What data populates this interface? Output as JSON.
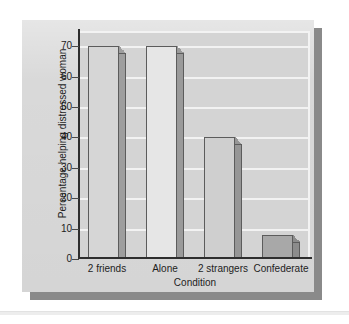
{
  "chart_data": {
    "type": "bar",
    "title": "",
    "subtitle": "",
    "categories": [
      "2 friends",
      "Alone",
      "2 strangers",
      "Confederate"
    ],
    "values": [
      70,
      70,
      40,
      8
    ],
    "series": [
      {
        "name": "Percentage helping distressed woman",
        "values": [
          70,
          70,
          40,
          8
        ]
      }
    ],
    "xlabel": "Condition",
    "ylabel": "Percentage helping distressed woman",
    "ylim": [
      0,
      75
    ],
    "yticks": [
      0,
      10,
      20,
      30,
      40,
      50,
      60,
      70
    ],
    "ytick_labels": [
      "0",
      "10",
      "20",
      "30",
      "40",
      "50",
      "60",
      "70"
    ],
    "grid": true,
    "gridline_color": "#f2f2f2",
    "legend": false,
    "legend_position": "none",
    "bar_colors": [
      "#d6d6d6",
      "#e6e6e6",
      "#cfcfcf",
      "#a8a8a8"
    ],
    "bar_side_colors": [
      "#9e9e9e",
      "#9a9a9a",
      "#969696",
      "#8c8c8c"
    ],
    "bar_edge_color": "#5c5c5c",
    "annotations": []
  },
  "figure": {
    "panel_color": "#d9d9d9",
    "shadow_color": "#8a8a8a",
    "plot_background": "#d4d4d4",
    "axis_color": "#2e2e2e",
    "text_color": "#1d1d1d"
  }
}
